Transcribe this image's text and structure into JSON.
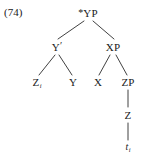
{
  "figure": {
    "example_number": "(74)",
    "type": "syntax-tree",
    "notation": "x-bar",
    "ink_color": "#2b2b2b",
    "background_color": "#ffffff"
  },
  "tree": {
    "root": {
      "name": "root-node",
      "star": "*",
      "label": "YP",
      "full_label": "*YP",
      "x": 88,
      "y": 13
    },
    "nodes": [
      {
        "name": "y-bar-node",
        "label": "Y",
        "prime": "′",
        "full_label": "Y′",
        "x": 57,
        "y": 47
      },
      {
        "name": "xp-node",
        "label": "XP",
        "full_label": "XP",
        "x": 113,
        "y": 47
      },
      {
        "name": "z-subject-node",
        "label": "Z",
        "subscript": "i",
        "full_label": "Zi",
        "x": 37,
        "y": 82
      },
      {
        "name": "y-head-node",
        "label": "Y",
        "full_label": "Y",
        "x": 73,
        "y": 82
      },
      {
        "name": "x-head-node",
        "label": "X",
        "full_label": "X",
        "x": 98,
        "y": 82
      },
      {
        "name": "zp-node",
        "label": "ZP",
        "full_label": "ZP",
        "x": 128,
        "y": 82
      },
      {
        "name": "z-node",
        "label": "Z",
        "full_label": "Z",
        "x": 128,
        "y": 115
      },
      {
        "name": "trace-node",
        "label": "t",
        "subscript": "i",
        "full_label": "ti",
        "x": 128,
        "y": 147
      }
    ],
    "branches": [
      {
        "name": "branch-root-to-ybar",
        "x1": 84,
        "y1": 21,
        "x2": 58,
        "y2": 39
      },
      {
        "name": "branch-root-to-xp",
        "x1": 93,
        "y1": 21,
        "x2": 114,
        "y2": 39
      },
      {
        "name": "branch-ybar-to-z",
        "x1": 55,
        "y1": 55,
        "x2": 39,
        "y2": 75
      },
      {
        "name": "branch-ybar-to-y",
        "x1": 59,
        "y1": 55,
        "x2": 72,
        "y2": 75
      },
      {
        "name": "branch-xp-to-x",
        "x1": 110,
        "y1": 55,
        "x2": 99,
        "y2": 75
      },
      {
        "name": "branch-xp-to-zp",
        "x1": 116,
        "y1": 55,
        "x2": 127,
        "y2": 75
      },
      {
        "name": "branch-zp-to-z",
        "x1": 128,
        "y1": 90,
        "x2": 128,
        "y2": 107
      },
      {
        "name": "branch-z-to-trace",
        "x1": 128,
        "y1": 123,
        "x2": 128,
        "y2": 140
      }
    ]
  }
}
